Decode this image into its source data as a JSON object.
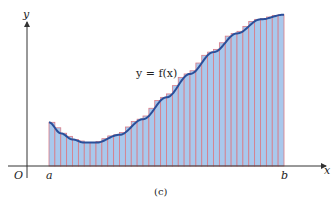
{
  "figure": {
    "caption": "(c)",
    "curve_label": "y = f(x)",
    "axis_labels": {
      "x": "x",
      "y": "y",
      "origin": "O",
      "a": "a",
      "b": "b"
    },
    "colors": {
      "fill": "#a9c8ec",
      "rect_edge": "#d97a86",
      "curve": "#2a4f9a",
      "axis": "#333333"
    }
  },
  "chart_data": {
    "type": "area",
    "caption": "(c)",
    "xlabel": "x",
    "ylabel": "y",
    "x_ticks": [
      "O",
      "a",
      "b"
    ],
    "annotations": [
      "y = f(x)"
    ],
    "num_rectangles": 40,
    "method": "right-endpoint rectangles (upper steps above curve on increasing part)",
    "curve_points_normalized": [
      {
        "x": 0.0,
        "y": 0.28
      },
      {
        "x": 0.05,
        "y": 0.21
      },
      {
        "x": 0.1,
        "y": 0.17
      },
      {
        "x": 0.15,
        "y": 0.15
      },
      {
        "x": 0.2,
        "y": 0.15
      },
      {
        "x": 0.3,
        "y": 0.2
      },
      {
        "x": 0.4,
        "y": 0.3
      },
      {
        "x": 0.5,
        "y": 0.44
      },
      {
        "x": 0.6,
        "y": 0.59
      },
      {
        "x": 0.7,
        "y": 0.73
      },
      {
        "x": 0.8,
        "y": 0.85
      },
      {
        "x": 0.9,
        "y": 0.94
      },
      {
        "x": 1.0,
        "y": 0.97
      }
    ],
    "grid": false
  }
}
